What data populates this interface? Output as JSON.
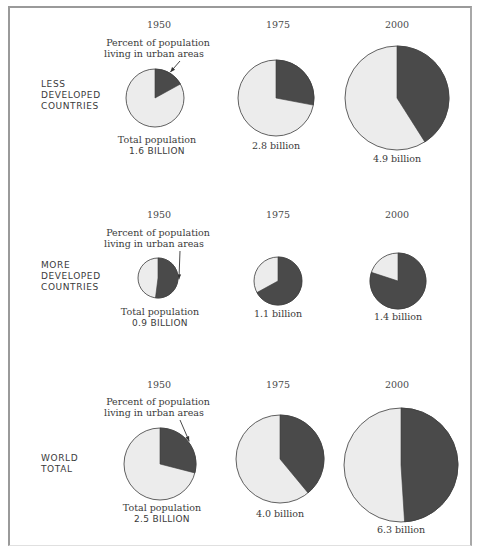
{
  "chart_data": {
    "type": "pie",
    "title": "",
    "legend": {
      "urban_label_line1": "Percent of population",
      "urban_label_line2": "living in urban areas",
      "total_label": "Total population"
    },
    "colors": {
      "urban": "#4a4a4a",
      "rural": "#ececec",
      "outline": "#3a3a3a"
    },
    "years": [
      "1950",
      "1975",
      "2000"
    ],
    "rows": [
      {
        "label_lines": [
          "LESS",
          "DEVELOPED",
          "COUNTRIES"
        ],
        "pies": [
          {
            "year": "1950",
            "urban_pct": 17,
            "total": "1.6 BILLION",
            "total_billion": 1.6
          },
          {
            "year": "1975",
            "urban_pct": 28,
            "total": "2.8 billion",
            "total_billion": 2.8
          },
          {
            "year": "2000",
            "urban_pct": 41,
            "total": "4.9 billion",
            "total_billion": 4.9
          }
        ]
      },
      {
        "label_lines": [
          "MORE",
          "DEVELOPED",
          "COUNTRIES"
        ],
        "pies": [
          {
            "year": "1950",
            "urban_pct": 52,
            "total": "0.9 BILLION",
            "total_billion": 0.9
          },
          {
            "year": "1975",
            "urban_pct": 67,
            "total": "1.1 billion",
            "total_billion": 1.1
          },
          {
            "year": "2000",
            "urban_pct": 80,
            "total": "1.4 billion",
            "total_billion": 1.4
          }
        ]
      },
      {
        "label_lines": [
          "WORLD",
          "TOTAL"
        ],
        "pies": [
          {
            "year": "1950",
            "urban_pct": 29,
            "total": "2.5 BILLION",
            "total_billion": 2.5
          },
          {
            "year": "1975",
            "urban_pct": 39,
            "total": "4.0 billion",
            "total_billion": 4.0
          },
          {
            "year": "2000",
            "urban_pct": 49,
            "total": "6.3 billion",
            "total_billion": 6.3
          }
        ]
      }
    ]
  },
  "layout": {
    "rows": [
      {
        "year_y": 28,
        "label_y": 87,
        "annot_y": 46,
        "pies": [
          {
            "cx": 155,
            "cy": 98,
            "r": 29,
            "label_y": 143
          },
          {
            "cx": 276,
            "cy": 98,
            "r": 38,
            "label_y": 149
          },
          {
            "cx": 397,
            "cy": 98,
            "r": 52,
            "label_y": 162
          }
        ]
      },
      {
        "year_y": 218,
        "label_y": 268,
        "annot_y": 236,
        "pies": [
          {
            "cx": 158,
            "cy": 278,
            "r": 20,
            "label_y": 315
          },
          {
            "cx": 278,
            "cy": 281,
            "r": 24,
            "label_y": 317
          },
          {
            "cx": 398,
            "cy": 281,
            "r": 28,
            "label_y": 320
          }
        ]
      },
      {
        "year_y": 388,
        "label_y": 461,
        "annot_y": 405,
        "pies": [
          {
            "cx": 160,
            "cy": 464,
            "r": 36,
            "label_y": 511
          },
          {
            "cx": 280,
            "cy": 459,
            "r": 44,
            "label_y": 517
          },
          {
            "cx": 401,
            "cy": 465,
            "r": 57,
            "label_y": 533
          }
        ]
      }
    ]
  }
}
